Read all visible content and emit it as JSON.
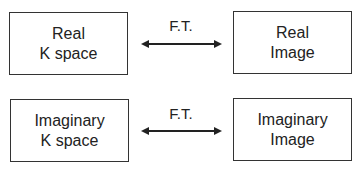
{
  "rows": [
    {
      "left": {
        "line1": "Real",
        "line2": "K space"
      },
      "label": "F.T.",
      "right": {
        "line1": "Real",
        "line2": "Image"
      }
    },
    {
      "left": {
        "line1": "Imaginary",
        "line2": "K space"
      },
      "label": "F.T.",
      "right": {
        "line1": "Imaginary",
        "line2": "Image"
      }
    }
  ],
  "colors": {
    "stroke": "#333333",
    "text": "#222222",
    "background": "#ffffff"
  }
}
